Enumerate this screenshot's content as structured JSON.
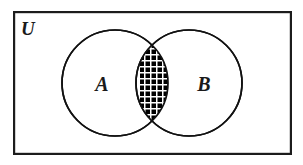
{
  "figure": {
    "kind": "venn-diagram",
    "caption_text": "",
    "universe": {
      "label": "U",
      "label_x": 21,
      "label_y": 35,
      "rect": {
        "x": 13,
        "y": 11,
        "width": 279,
        "height": 144
      },
      "stroke": "#1c1c1c",
      "stroke_width": 2.2,
      "fill": "#ffffff"
    },
    "sets": [
      {
        "label": "A",
        "label_x": 102,
        "label_y": 91,
        "cx": 115,
        "cy": 83,
        "r": 53,
        "stroke": "#1c1c1c",
        "stroke_width": 1.7,
        "fill": "#ffffff"
      },
      {
        "label": "B",
        "label_x": 204,
        "label_y": 91,
        "cx": 189,
        "cy": 83,
        "r": 53,
        "stroke": "#1c1c1c",
        "stroke_width": 1.7,
        "fill": "#ffffff"
      }
    ],
    "shaded_region": {
      "name": "A-intersect-B",
      "notation": "A ∩ B",
      "pattern": "cross-hatch-grid",
      "pattern_pitch_px": 6,
      "pattern_line_color": "#000000",
      "pattern_gap_color": "#ffffff",
      "pattern_line_width": 4.1
    },
    "colors": {
      "ink": "#1c1c1c",
      "paper": "#ffffff",
      "shade": "#000000"
    }
  }
}
